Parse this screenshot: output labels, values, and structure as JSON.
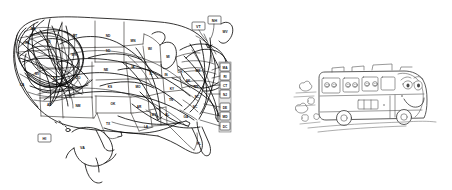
{
  "illustration": {
    "title": "Hand-drawn US road trip map with tour bus",
    "background_color": "#ffffff",
    "ink_color": "#12110f",
    "bus_ink_color": "#4a4a4a"
  },
  "map": {
    "name": "united-states-map",
    "caption": "Scribbled travel routes across the United States",
    "state_labels": [
      {
        "abbr": "WA",
        "x": 33,
        "y": 30
      },
      {
        "abbr": "OR",
        "x": 27,
        "y": 44
      },
      {
        "abbr": "ID",
        "x": 49,
        "y": 43
      },
      {
        "abbr": "MT",
        "x": 75,
        "y": 37
      },
      {
        "abbr": "ND",
        "x": 108,
        "y": 37
      },
      {
        "abbr": "SD",
        "x": 108,
        "y": 52
      },
      {
        "abbr": "WY",
        "x": 74,
        "y": 56
      },
      {
        "abbr": "NE",
        "x": 106,
        "y": 71
      },
      {
        "abbr": "KS",
        "x": 110,
        "y": 88
      },
      {
        "abbr": "OK",
        "x": 113,
        "y": 105
      },
      {
        "abbr": "TX",
        "x": 108,
        "y": 125
      },
      {
        "abbr": "NM",
        "x": 78,
        "y": 107
      },
      {
        "abbr": "AZ",
        "x": 49,
        "y": 106
      },
      {
        "abbr": "UT",
        "x": 55,
        "y": 80
      },
      {
        "abbr": "NV",
        "x": 37,
        "y": 75
      },
      {
        "abbr": "CA",
        "x": 22,
        "y": 86
      },
      {
        "abbr": "CO",
        "x": 78,
        "y": 79
      },
      {
        "abbr": "MN",
        "x": 133,
        "y": 42
      },
      {
        "abbr": "IA",
        "x": 133,
        "y": 68
      },
      {
        "abbr": "MO",
        "x": 138,
        "y": 88
      },
      {
        "abbr": "AR",
        "x": 139,
        "y": 108
      },
      {
        "abbr": "LA",
        "x": 146,
        "y": 128
      },
      {
        "abbr": "WI",
        "x": 150,
        "y": 50
      },
      {
        "abbr": "IL",
        "x": 151,
        "y": 75
      },
      {
        "abbr": "MI",
        "x": 168,
        "y": 58
      },
      {
        "abbr": "IN",
        "x": 166,
        "y": 76
      },
      {
        "abbr": "OH",
        "x": 180,
        "y": 73
      },
      {
        "abbr": "KY",
        "x": 172,
        "y": 90
      },
      {
        "abbr": "TN",
        "x": 171,
        "y": 101
      },
      {
        "abbr": "MS",
        "x": 154,
        "y": 116
      },
      {
        "abbr": "AL",
        "x": 167,
        "y": 116
      },
      {
        "abbr": "GA",
        "x": 186,
        "y": 118
      },
      {
        "abbr": "FL",
        "x": 199,
        "y": 145
      },
      {
        "abbr": "SC",
        "x": 195,
        "y": 108
      },
      {
        "abbr": "NC",
        "x": 197,
        "y": 98
      },
      {
        "abbr": "VA",
        "x": 196,
        "y": 88
      },
      {
        "abbr": "WV",
        "x": 188,
        "y": 82
      },
      {
        "abbr": "PA",
        "x": 198,
        "y": 72
      },
      {
        "abbr": "NY",
        "x": 202,
        "y": 57
      },
      {
        "abbr": "AK",
        "x": 80,
        "y": 148
      },
      {
        "abbr": "ME",
        "x": 225,
        "y": 31
      }
    ],
    "callouts": [
      {
        "abbr": "VT",
        "x": 198,
        "y": 27,
        "type": "boxed-callout"
      },
      {
        "abbr": "NH",
        "x": 214,
        "y": 21,
        "type": "boxed-callout"
      },
      {
        "abbr": "HI",
        "x": 46,
        "y": 138,
        "type": "boxed-inset"
      }
    ],
    "northeast_stack": {
      "name": "northeast-state-callout-column",
      "items": [
        "MA",
        "RI",
        "CT",
        "NJ",
        "DE",
        "MD",
        "DC"
      ]
    },
    "insets": [
      {
        "name": "hawaii-inset",
        "abbr": "HI"
      },
      {
        "name": "alaska-inset",
        "abbr": "AK"
      }
    ]
  },
  "bus": {
    "name": "tour-bus",
    "caption": "Smiling cartoon tour bus driving with dust clouds",
    "face": {
      "expression": "smiling",
      "eyes": 2
    },
    "passenger_count": 6,
    "wheel_count": 2,
    "dust_cloud_count": 5,
    "speed_line_count": 4
  }
}
